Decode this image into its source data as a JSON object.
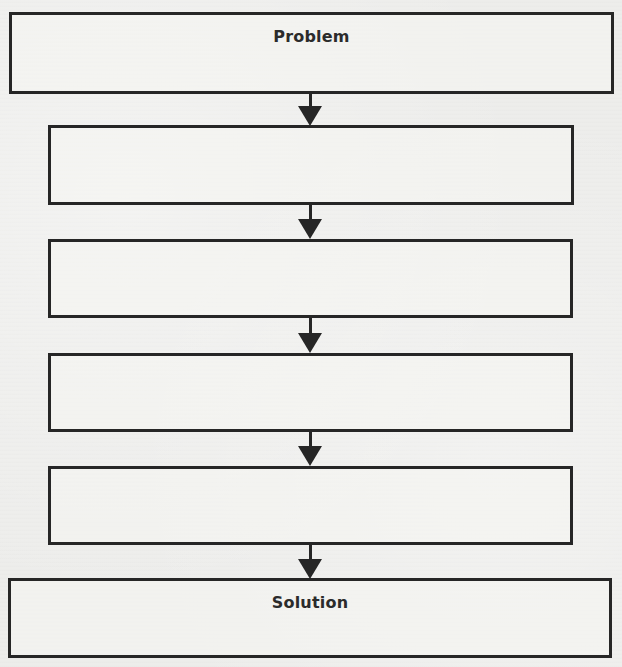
{
  "diagram": {
    "type": "flowchart",
    "direction": "top-to-bottom",
    "nodes": [
      {
        "id": "problem",
        "label": "Problem"
      },
      {
        "id": "step-1",
        "label": ""
      },
      {
        "id": "step-2",
        "label": ""
      },
      {
        "id": "step-3",
        "label": ""
      },
      {
        "id": "step-4",
        "label": ""
      },
      {
        "id": "solution",
        "label": "Solution"
      }
    ],
    "edges": [
      {
        "from": "problem",
        "to": "step-1"
      },
      {
        "from": "step-1",
        "to": "step-2"
      },
      {
        "from": "step-2",
        "to": "step-3"
      },
      {
        "from": "step-3",
        "to": "step-4"
      },
      {
        "from": "step-4",
        "to": "solution"
      }
    ]
  },
  "colors": {
    "border": "#262626",
    "background": "#ededeb",
    "label": "#2b2b2b"
  }
}
